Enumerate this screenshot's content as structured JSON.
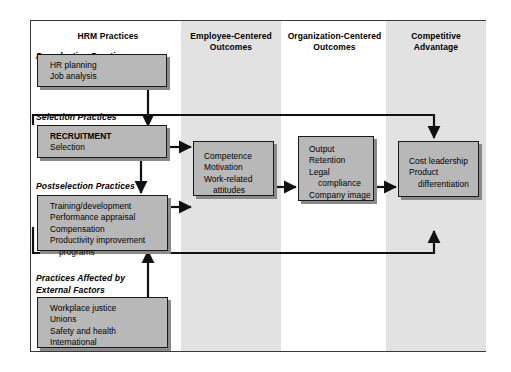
{
  "diagram": {
    "columns": [
      {
        "id": "hrm",
        "label_line1": "HRM Practices",
        "label_line2": "",
        "shaded": false
      },
      {
        "id": "employee",
        "label_line1": "Employee-Centered",
        "label_line2": "Outcomes",
        "shaded": true
      },
      {
        "id": "organization",
        "label_line1": "Organization-Centered",
        "label_line2": "Outcomes",
        "shaded": false
      },
      {
        "id": "competitive",
        "label_line1": "Competitive",
        "label_line2": "Advantage",
        "shaded": true
      }
    ],
    "section_labels": [
      {
        "id": "preselection",
        "text": "Preselection Practices"
      },
      {
        "id": "selection",
        "text": "Selection Practices"
      },
      {
        "id": "postselection",
        "text": "Postselection Practices"
      },
      {
        "id": "external_line1",
        "text": "Practices Affected by"
      },
      {
        "id": "external_line2",
        "text": "External Factors"
      }
    ],
    "boxes": {
      "preselection": {
        "items": [
          "HR planning",
          "Job analysis"
        ]
      },
      "selection": {
        "heading": "RECRUITMENT",
        "items": [
          "Selection"
        ]
      },
      "postselection": {
        "items": [
          "Training/development",
          "Performance appraisal",
          "Compensation",
          "Productivity improvement",
          "programs"
        ]
      },
      "external": {
        "items": [
          "Workplace justice",
          "Unions",
          "Safety and health",
          "International"
        ]
      },
      "employee_outcomes": {
        "items": [
          "Competence",
          "Motivation",
          "Work-related",
          "attitudes"
        ]
      },
      "organization_outcomes": {
        "items": [
          "Output",
          "Retention",
          "Legal",
          "compliance",
          "Company image"
        ]
      },
      "competitive_advantage": {
        "items": [
          "Cost leadership",
          "Product",
          "differentiation"
        ]
      }
    },
    "colors": {
      "box_fill": "#b8b8b8",
      "box_border": "#1a1a1a",
      "band_shade": "#e2e2e2",
      "frame_border": "#3a3a3a",
      "page_background": "#ffffff"
    }
  }
}
